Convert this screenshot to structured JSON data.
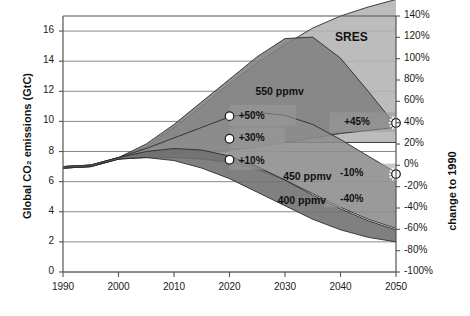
{
  "chart_data": {
    "type": "area",
    "title": "",
    "ylabel_left": "Global CO₂ emissions (GtC)",
    "ylabel_right": "change to 1990",
    "xlabel": "",
    "xlim": [
      1990,
      2050
    ],
    "ylim_left": [
      0,
      17
    ],
    "ylim_right": [
      -100,
      140
    ],
    "grid": true,
    "legend_position": "none",
    "x_ticks": [
      "1990",
      "2000",
      "2010",
      "2020",
      "2030",
      "2040",
      "2050"
    ],
    "x_tick_values": [
      1990,
      2000,
      2010,
      2020,
      2030,
      2040,
      2050
    ],
    "y_ticks_left": [
      "0",
      "2",
      "4",
      "6",
      "8",
      "10",
      "12",
      "14",
      "16"
    ],
    "y_tick_values_left": [
      0,
      2,
      4,
      6,
      8,
      10,
      12,
      14,
      16
    ],
    "y_ticks_right": [
      "140%",
      "120%",
      "100%",
      "80%",
      "60%",
      "40%",
      "20%",
      "0%",
      "-20%",
      "-40%",
      "-60%",
      "-80%",
      "-100%"
    ],
    "y_tick_values_right": [
      140,
      120,
      100,
      80,
      60,
      40,
      20,
      0,
      -20,
      -40,
      -60,
      -80,
      -100
    ],
    "annotations": [
      {
        "text": "SRES",
        "x": 2042,
        "y": 15.6
      },
      {
        "text": "550 ppmv",
        "x": 2029,
        "y": 12.0
      },
      {
        "text": "450 ppmv",
        "x": 2034,
        "y": 6.4
      },
      {
        "text": "400 ppmv",
        "x": 2033,
        "y": 4.8
      },
      {
        "text": "+50%",
        "x": 2024,
        "y": 10.4
      },
      {
        "text": "+30%",
        "x": 2024,
        "y": 8.9
      },
      {
        "text": "+10%",
        "x": 2024,
        "y": 7.4
      },
      {
        "text": "+45%",
        "x": 2043,
        "y": 10.0
      },
      {
        "text": "-10%",
        "x": 2042,
        "y": 6.6
      },
      {
        "text": "-40%",
        "x": 2042,
        "y": 4.9
      }
    ],
    "markers": [
      {
        "name": "marker-2020-plus50",
        "style": "circle",
        "x": 2020,
        "y": 10.35,
        "pct": 50
      },
      {
        "name": "marker-2020-plus30",
        "style": "circle",
        "x": 2020,
        "y": 8.85,
        "pct": 30
      },
      {
        "name": "marker-2020-plus10",
        "style": "circle",
        "x": 2020,
        "y": 7.45,
        "pct": 10
      },
      {
        "name": "marker-2050-plus45",
        "style": "starburst",
        "x": 2050,
        "y": 9.9,
        "pct": 45
      },
      {
        "name": "marker-2050-minus10",
        "style": "starburst",
        "x": 2050,
        "y": 6.5,
        "pct": -10
      }
    ],
    "bands": [
      {
        "name": "SRES",
        "fill": "#b3b3b3",
        "upper": [
          [
            1990,
            7.0
          ],
          [
            1995,
            7.1
          ],
          [
            2000,
            7.6
          ],
          [
            2005,
            8.3
          ],
          [
            2010,
            9.6
          ],
          [
            2015,
            11.0
          ],
          [
            2020,
            12.5
          ],
          [
            2025,
            13.9
          ],
          [
            2030,
            15.1
          ],
          [
            2035,
            16.2
          ],
          [
            2040,
            17.0
          ],
          [
            2045,
            17.6
          ],
          [
            2050,
            18.1
          ]
        ],
        "lower": [
          [
            1990,
            6.9
          ],
          [
            1995,
            7.0
          ],
          [
            2000,
            7.5
          ],
          [
            2005,
            7.8
          ],
          [
            2010,
            8.1
          ],
          [
            2015,
            8.3
          ],
          [
            2020,
            8.5
          ],
          [
            2025,
            8.6
          ],
          [
            2030,
            8.6
          ],
          [
            2035,
            8.6
          ],
          [
            2040,
            8.6
          ],
          [
            2045,
            8.6
          ],
          [
            2050,
            8.6
          ]
        ]
      },
      {
        "name": "550 ppmv",
        "fill": "#818181",
        "upper": [
          [
            1990,
            7.0
          ],
          [
            1995,
            7.1
          ],
          [
            2000,
            7.6
          ],
          [
            2005,
            8.5
          ],
          [
            2010,
            9.8
          ],
          [
            2015,
            11.3
          ],
          [
            2020,
            12.8
          ],
          [
            2025,
            14.3
          ],
          [
            2030,
            15.5
          ],
          [
            2035,
            15.6
          ],
          [
            2040,
            14.2
          ],
          [
            2045,
            12.0
          ],
          [
            2050,
            9.7
          ]
        ],
        "lower": [
          [
            1990,
            6.9
          ],
          [
            1995,
            7.0
          ],
          [
            2000,
            7.5
          ],
          [
            2005,
            7.7
          ],
          [
            2010,
            7.9
          ],
          [
            2015,
            8.0
          ],
          [
            2020,
            8.1
          ],
          [
            2025,
            8.3
          ],
          [
            2030,
            8.6
          ],
          [
            2035,
            8.9
          ],
          [
            2040,
            9.2
          ],
          [
            2045,
            9.4
          ],
          [
            2050,
            9.6
          ]
        ]
      },
      {
        "name": "450 ppmv",
        "fill": "#8c8c8c",
        "upper": [
          [
            1990,
            7.0
          ],
          [
            1995,
            7.1
          ],
          [
            2000,
            7.6
          ],
          [
            2005,
            8.2
          ],
          [
            2010,
            8.9
          ],
          [
            2015,
            9.6
          ],
          [
            2020,
            10.3
          ],
          [
            2025,
            10.6
          ],
          [
            2030,
            10.4
          ],
          [
            2035,
            9.8
          ],
          [
            2040,
            8.8
          ],
          [
            2045,
            7.7
          ],
          [
            2050,
            6.6
          ]
        ],
        "lower": [
          [
            1990,
            6.9
          ],
          [
            1995,
            7.0
          ],
          [
            2000,
            7.5
          ],
          [
            2005,
            7.6
          ],
          [
            2010,
            7.6
          ],
          [
            2015,
            7.5
          ],
          [
            2020,
            7.3
          ],
          [
            2025,
            6.8
          ],
          [
            2030,
            6.1
          ],
          [
            2035,
            5.2
          ],
          [
            2040,
            4.3
          ],
          [
            2045,
            3.5
          ],
          [
            2050,
            2.9
          ]
        ]
      },
      {
        "name": "400 ppmv",
        "fill": "#6e6e6e",
        "upper": [
          [
            1990,
            7.0
          ],
          [
            1995,
            7.1
          ],
          [
            2000,
            7.6
          ],
          [
            2005,
            8.0
          ],
          [
            2010,
            8.2
          ],
          [
            2015,
            8.1
          ],
          [
            2020,
            7.7
          ],
          [
            2025,
            7.0
          ],
          [
            2030,
            6.1
          ],
          [
            2035,
            5.1
          ],
          [
            2040,
            4.2
          ],
          [
            2045,
            3.4
          ],
          [
            2050,
            2.8
          ]
        ],
        "lower": [
          [
            1990,
            6.9
          ],
          [
            1995,
            7.0
          ],
          [
            2000,
            7.5
          ],
          [
            2005,
            7.6
          ],
          [
            2010,
            7.4
          ],
          [
            2015,
            6.9
          ],
          [
            2020,
            6.2
          ],
          [
            2025,
            5.3
          ],
          [
            2030,
            4.4
          ],
          [
            2035,
            3.5
          ],
          [
            2040,
            2.8
          ],
          [
            2045,
            2.3
          ],
          [
            2050,
            2.0
          ]
        ]
      }
    ]
  },
  "axes": {
    "ylabel_left": "Global CO₂ emissions (GtC)",
    "ylabel_right": "change to 1990"
  }
}
